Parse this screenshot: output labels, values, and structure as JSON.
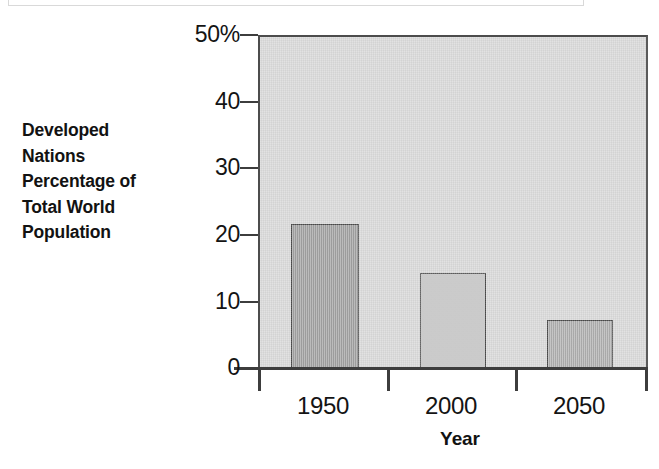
{
  "chart_data": {
    "type": "bar",
    "title": "",
    "subtitle": "",
    "xlabel": "Year",
    "ylabel": "Developed Nations Percentage of Total World Population",
    "categories": [
      "1950",
      "2000",
      "2050"
    ],
    "values": [
      21.7,
      14.4,
      7.2
    ],
    "series": [
      {
        "name": "Developed Nations Percentage of Total World Population",
        "values": [
          21.7,
          14.4,
          7.2
        ]
      }
    ],
    "ylim": [
      0,
      50
    ],
    "xlim": [
      0,
      3
    ],
    "y_ticks": [
      0,
      10,
      20,
      30,
      40,
      50
    ],
    "y_tick_labels": [
      "0",
      "10",
      "20",
      "30",
      "40",
      "50%"
    ],
    "grid": false,
    "legend": false,
    "legend_position": "none",
    "units": "percent",
    "bar_colors": [
      "#9c9c9c",
      "#c4c4c4",
      "#ababab"
    ],
    "plot_background": "#d8d8d8",
    "axis_color": "#3d3d3d",
    "text_color": "#141414"
  },
  "axis": {
    "y_label_lines": [
      "Developed",
      "Nations",
      "Percentage of",
      "Total World",
      "Population"
    ],
    "y_label_full": "Developed Nations Percentage of Total World Population",
    "x_title": "Year",
    "y_ticks": [
      {
        "label": "50%",
        "value": 50
      },
      {
        "label": "40",
        "value": 40
      },
      {
        "label": "30",
        "value": 30
      },
      {
        "label": "20",
        "value": 20
      },
      {
        "label": "10",
        "value": 10
      },
      {
        "label": "0",
        "value": 0
      }
    ],
    "x_ticks": [
      {
        "label": "1950",
        "value": 21.7
      },
      {
        "label": "2000",
        "value": 14.4
      },
      {
        "label": "2050",
        "value": 7.2
      }
    ]
  }
}
